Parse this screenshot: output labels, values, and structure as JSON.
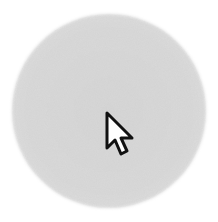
{
  "scene": {
    "background_color": "#ffffff",
    "spotlight": {
      "shape": "circle",
      "fill_color": "#d8d8d8",
      "texture": "noise"
    },
    "cursor": {
      "icon": "arrow-pointer-icon",
      "fill_color": "#ffffff",
      "outline_color": "#111111"
    }
  }
}
